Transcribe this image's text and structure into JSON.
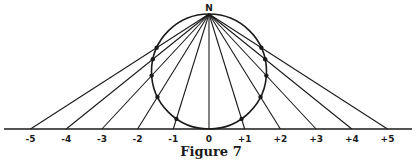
{
  "figure": {
    "caption": "Figure 7",
    "pole_label": "N",
    "axis_ticks": [
      "-5",
      "-4",
      "-3",
      "-2",
      "-1",
      "0",
      "+1",
      "+2",
      "+3",
      "+4",
      "+5"
    ],
    "axis_values": [
      -5,
      -4,
      -3,
      -2,
      -1,
      0,
      1,
      2,
      3,
      4,
      5
    ],
    "color": "#1a1a1a"
  }
}
